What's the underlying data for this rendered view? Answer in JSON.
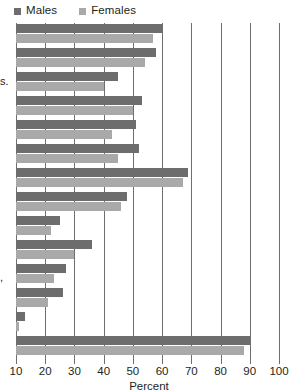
{
  "legend": {
    "entries": [
      {
        "label": "Males",
        "color": "#6d6d6d",
        "icon": "square-swatch-icon"
      },
      {
        "label": "Females",
        "color": "#a9a9a9",
        "icon": "square-swatch-icon"
      }
    ]
  },
  "axis": {
    "title": "Percent",
    "ticks": [
      10,
      20,
      30,
      40,
      50,
      60,
      70,
      80,
      90,
      100
    ],
    "tick_labels": [
      "10",
      "20",
      "30",
      "40",
      "50",
      "60",
      "70",
      "80",
      "90",
      "100"
    ]
  },
  "cropped_labels": [
    {
      "text": "s.",
      "top": 76
    },
    {
      "text": ",",
      "top": 272
    }
  ],
  "chart_data": {
    "type": "bar",
    "orientation": "horizontal",
    "title": "",
    "subtitle": "",
    "xlabel": "Percent",
    "ylabel": "",
    "xlim": [
      10,
      100
    ],
    "xticks": [
      10,
      20,
      30,
      40,
      50,
      60,
      70,
      80,
      90,
      100
    ],
    "grid": true,
    "grid_axis": "x",
    "legend_position": "top-left",
    "categories": [
      "",
      "",
      "",
      "",
      "",
      "",
      "",
      "",
      "",
      "",
      "",
      "",
      "",
      ""
    ],
    "series": [
      {
        "name": "Males",
        "color": "#6d6d6d",
        "values": [
          60.0,
          58.0,
          45.0,
          53.0,
          51.0,
          52.0,
          69.0,
          48.0,
          25.0,
          36.0,
          27.0,
          26.0,
          13.0,
          90.0
        ]
      },
      {
        "name": "Females",
        "color": "#a9a9a9",
        "values": [
          57.0,
          54.0,
          40.0,
          50.0,
          43.0,
          45.0,
          67.0,
          46.0,
          22.0,
          30.0,
          23.0,
          21.0,
          11.0,
          88.0
        ]
      }
    ]
  }
}
